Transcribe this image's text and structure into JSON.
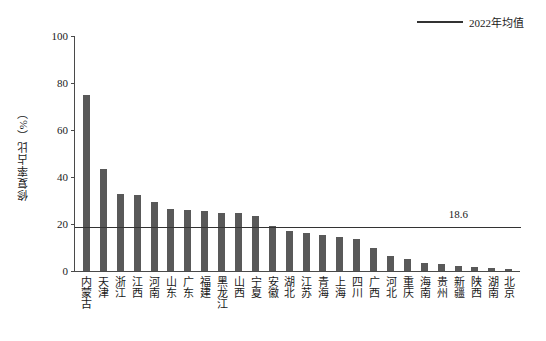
{
  "legend": {
    "label": "2022年均值",
    "line_color": "#333333"
  },
  "axis": {
    "y_title": "修复率占比（%）",
    "y_ticks": [
      "0",
      "20",
      "40",
      "60",
      "80",
      "100"
    ]
  },
  "annotation": {
    "avg_value_label": "18.6"
  },
  "colors": {
    "bar": "#595959",
    "axis": "#4a4a4a",
    "average_line": "#333333"
  },
  "chart_data": {
    "type": "bar",
    "title": "",
    "xlabel": "",
    "ylabel": "修复率占比（%）",
    "ylim": [
      0,
      100
    ],
    "yticks": [
      0,
      20,
      40,
      60,
      80,
      100
    ],
    "grid": false,
    "legend_position": "top-right",
    "categories": [
      "内蒙古",
      "天津",
      "浙江",
      "江西",
      "河南",
      "山东",
      "广东",
      "福建",
      "黑龙江",
      "山西",
      "宁夏",
      "安徽",
      "湖北",
      "江苏",
      "青海",
      "上海",
      "四川",
      "广西",
      "河北",
      "重庆",
      "海南",
      "贵州",
      "新疆",
      "陕西",
      "湖南",
      "北京"
    ],
    "values": [
      74.7,
      43.2,
      32.9,
      32.3,
      29.2,
      26.6,
      25.8,
      25.5,
      24.9,
      24.6,
      23.5,
      19.2,
      17.2,
      16.3,
      15.2,
      14.4,
      13.5,
      9.8,
      6.2,
      5.0,
      3.4,
      3.0,
      2.2,
      1.9,
      1.2,
      0.9
    ],
    "series": [
      {
        "name": "修复率占比（%）",
        "values": [
          74.7,
          43.2,
          32.9,
          32.3,
          29.2,
          26.6,
          25.8,
          25.5,
          24.9,
          24.6,
          23.5,
          19.2,
          17.2,
          16.3,
          15.2,
          14.4,
          13.5,
          9.8,
          6.2,
          5.0,
          3.4,
          3.0,
          2.2,
          1.9,
          1.2,
          0.9
        ]
      }
    ],
    "reference_line": {
      "name": "2022年均值",
      "value": 18.6,
      "label": "18.6"
    }
  }
}
